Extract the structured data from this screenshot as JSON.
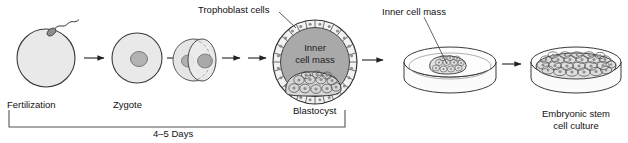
{
  "figure": {
    "background_color": "#ffffff",
    "line_color": "#333333",
    "cell_fill": "#e9e9e9",
    "nucleus_fill": "#b3b3b3",
    "cavity_fill": "#a9a9a9"
  },
  "labels": {
    "fertilization": "Fertilization",
    "zygote": "Zygote",
    "trophoblast": "Trophoblast cells",
    "blastocyst": "Blastocyst",
    "inner_cell_mass_in_blastocyst_line1": "Inner",
    "inner_cell_mass_in_blastocyst_line2": "cell mass",
    "inner_cell_mass_dish": "Inner cell mass",
    "esc_line1": "Embryonic stem",
    "esc_line2": "cell culture",
    "timeline": "4–5 Days"
  },
  "stages": [
    {
      "id": "fertilization",
      "label": "Fertilization",
      "description": "Egg with sperm attaching"
    },
    {
      "id": "zygote",
      "label": "Zygote",
      "description": "Single cell with nucleus"
    },
    {
      "id": "cleavage",
      "label": "",
      "description": "Two-cell dividing embryo"
    },
    {
      "id": "blastocyst",
      "label": "Blastocyst",
      "description": "Trophoblast ring with inner cell mass"
    },
    {
      "id": "icm-dish",
      "label": "Inner cell mass",
      "description": "Inner cell mass plated in petri dish"
    },
    {
      "id": "esc-culture",
      "label": "Embryonic stem cell culture",
      "description": "Confluent stem cell monolayer in petri dish"
    }
  ],
  "arrows": [
    {
      "from": "fertilization",
      "to": "zygote"
    },
    {
      "from": "zygote",
      "to": "cleavage"
    },
    {
      "from": "cleavage",
      "to": "blastocyst-a"
    },
    {
      "from": "blastocyst-a",
      "to": "blastocyst"
    },
    {
      "from": "blastocyst",
      "to": "icm-dish"
    },
    {
      "from": "icm-dish",
      "to": "esc-culture"
    }
  ],
  "timeline": {
    "text": "4–5 Days",
    "spans_from": "Fertilization",
    "spans_to": "Blastocyst"
  }
}
